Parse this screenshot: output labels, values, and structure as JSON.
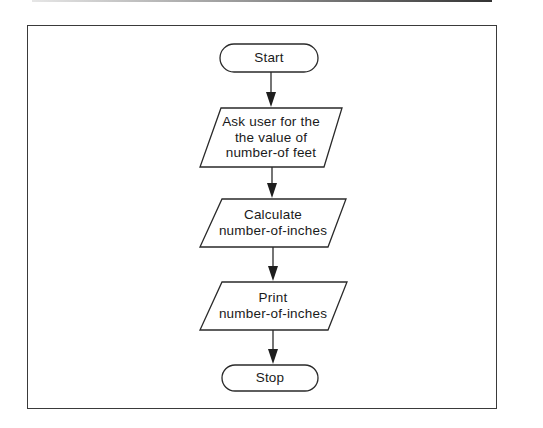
{
  "diagram": {
    "type": "flowchart",
    "nodes": [
      {
        "id": "start",
        "shape": "terminal",
        "lines": [
          "Start"
        ]
      },
      {
        "id": "input",
        "shape": "parallelogram",
        "lines": [
          "Ask user for the",
          "the value of",
          "number-of feet"
        ]
      },
      {
        "id": "calc",
        "shape": "parallelogram",
        "lines": [
          "Calculate",
          "number-of-inches"
        ]
      },
      {
        "id": "print",
        "shape": "parallelogram",
        "lines": [
          "Print",
          "number-of-inches"
        ]
      },
      {
        "id": "stop",
        "shape": "terminal",
        "lines": [
          "Stop"
        ]
      }
    ],
    "edges": [
      {
        "from": "start",
        "to": "input"
      },
      {
        "from": "input",
        "to": "calc"
      },
      {
        "from": "calc",
        "to": "print"
      },
      {
        "from": "print",
        "to": "stop"
      }
    ],
    "colors": {
      "stroke": "#2a2a2a",
      "background": "#ffffff",
      "text": "#1a1a1a"
    }
  }
}
